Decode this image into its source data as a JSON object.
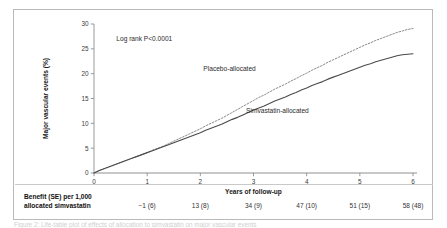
{
  "figure": {
    "annotation": "Log rank P<0.0001",
    "caption": "Figure 2: Life-table plot of effects of allocation to simvastatin on major vascular events",
    "colors": {
      "placebo_line": "#8a8a8a",
      "simvastatin_line": "#4a4a4a",
      "axis": "#8f8f8f",
      "frame": "#b9b9b9"
    }
  },
  "chart_data": {
    "type": "line",
    "title": "",
    "xlabel": "Years of follow-up",
    "ylabel": "Major vascular events (%)",
    "xlim": [
      0,
      6
    ],
    "ylim": [
      0,
      30
    ],
    "xticks": [
      0,
      1,
      2,
      3,
      4,
      5,
      6
    ],
    "yticks": [
      0,
      5,
      10,
      15,
      20,
      25,
      30
    ],
    "xtick_labels": [
      "0",
      "1",
      "2",
      "3",
      "4",
      "5",
      "6"
    ],
    "ytick_labels": [
      "0",
      "5",
      "10",
      "15",
      "20",
      "25",
      "30"
    ],
    "grid": false,
    "legend_position": "inline-annotation",
    "annotations": [
      "Log rank P<0.0001"
    ],
    "series": [
      {
        "name": "Placebo-allocated",
        "style": "dashed",
        "label_x": 2.55,
        "label_y": 20.6,
        "x": [
          0,
          0.1,
          0.2,
          0.3,
          0.4,
          0.5,
          0.6,
          0.7,
          0.8,
          0.9,
          1.0,
          1.1,
          1.2,
          1.3,
          1.4,
          1.5,
          1.6,
          1.7,
          1.8,
          1.9,
          2.0,
          2.1,
          2.2,
          2.3,
          2.4,
          2.5,
          2.6,
          2.7,
          2.8,
          2.9,
          3.0,
          3.1,
          3.2,
          3.3,
          3.4,
          3.5,
          3.6,
          3.7,
          3.8,
          3.9,
          4.0,
          4.1,
          4.2,
          4.3,
          4.4,
          4.5,
          4.6,
          4.7,
          4.8,
          4.9,
          5.0,
          5.1,
          5.2,
          5.3,
          5.4,
          5.5,
          5.6,
          5.7,
          5.8,
          5.9,
          6.0
        ],
        "y": [
          0,
          0.5,
          0.9,
          1.3,
          1.7,
          2.1,
          2.5,
          2.9,
          3.3,
          3.7,
          4.1,
          4.6,
          5.0,
          5.4,
          5.9,
          6.4,
          6.9,
          7.4,
          7.9,
          8.4,
          8.9,
          9.5,
          10.0,
          10.5,
          11.0,
          11.6,
          12.2,
          12.8,
          13.4,
          14.0,
          14.6,
          15.2,
          15.7,
          16.3,
          16.9,
          17.4,
          17.9,
          18.5,
          19.0,
          19.6,
          20.1,
          20.7,
          21.2,
          21.7,
          22.3,
          22.8,
          23.3,
          23.8,
          24.3,
          24.8,
          25.3,
          25.8,
          26.2,
          26.7,
          27.1,
          27.5,
          27.9,
          28.3,
          28.6,
          28.9,
          29.1
        ]
      },
      {
        "name": "Simvastatin-allocated",
        "style": "solid",
        "label_x": 3.45,
        "label_y": 12.0,
        "x": [
          0,
          0.1,
          0.2,
          0.3,
          0.4,
          0.5,
          0.6,
          0.7,
          0.8,
          0.9,
          1.0,
          1.1,
          1.2,
          1.3,
          1.4,
          1.5,
          1.6,
          1.7,
          1.8,
          1.9,
          2.0,
          2.1,
          2.2,
          2.3,
          2.4,
          2.5,
          2.6,
          2.7,
          2.8,
          2.9,
          3.0,
          3.1,
          3.2,
          3.3,
          3.4,
          3.5,
          3.6,
          3.7,
          3.8,
          3.9,
          4.0,
          4.1,
          4.2,
          4.3,
          4.4,
          4.5,
          4.6,
          4.7,
          4.8,
          4.9,
          5.0,
          5.1,
          5.2,
          5.3,
          5.4,
          5.5,
          5.6,
          5.7,
          5.8,
          5.9,
          6.0
        ],
        "y": [
          0,
          0.5,
          0.9,
          1.3,
          1.7,
          2.1,
          2.5,
          2.9,
          3.3,
          3.7,
          4.1,
          4.5,
          4.9,
          5.3,
          5.7,
          6.1,
          6.5,
          6.9,
          7.3,
          7.7,
          8.1,
          8.6,
          9.0,
          9.4,
          9.8,
          10.3,
          10.8,
          11.2,
          11.7,
          12.2,
          12.7,
          13.1,
          13.5,
          14.0,
          14.5,
          14.9,
          15.3,
          15.8,
          16.2,
          16.7,
          17.1,
          17.6,
          18.0,
          18.4,
          18.9,
          19.3,
          19.7,
          20.1,
          20.5,
          20.9,
          21.3,
          21.7,
          22.0,
          22.4,
          22.7,
          23.0,
          23.3,
          23.6,
          23.8,
          23.9,
          24.0
        ]
      }
    ]
  },
  "benefit_table": {
    "label_line1": "Benefit (SE) per 1,000",
    "label_line2": "allocated simvastatin",
    "values": [
      {
        "year": 1,
        "text": "−1 (6)"
      },
      {
        "year": 2,
        "text": "13 (8)"
      },
      {
        "year": 3,
        "text": "34 (9)"
      },
      {
        "year": 4,
        "text": "47 (10)"
      },
      {
        "year": 5,
        "text": "51 (15)"
      },
      {
        "year": 6,
        "text": "58 (48)"
      }
    ]
  }
}
